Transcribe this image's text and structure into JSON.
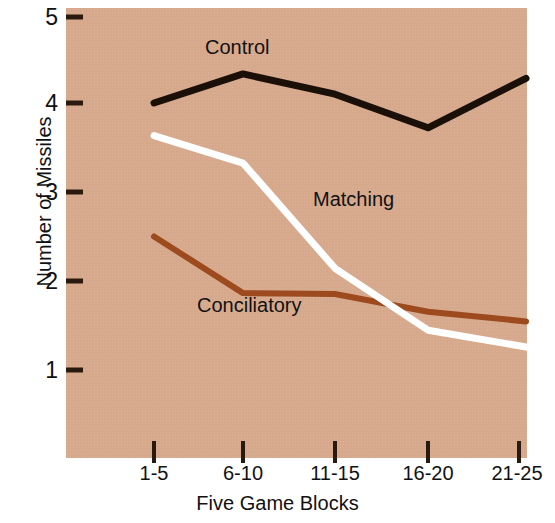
{
  "chart_data": {
    "type": "line",
    "title": "",
    "xlabel": "Five Game Blocks",
    "ylabel": "Number of Missiles",
    "categories": [
      "1-5",
      "6-10",
      "11-15",
      "16-20",
      "21-25"
    ],
    "ylim": [
      0.35,
      5.0
    ],
    "yticks": [
      1,
      2,
      3,
      4,
      5
    ],
    "ytick_labels": [
      "1",
      "2",
      "3",
      "4",
      "5"
    ],
    "grid": false,
    "legend": "inline-annotations",
    "background_color": "#d7a98c",
    "series": [
      {
        "name": "Control",
        "color": "#1a1008",
        "values": [
          4.02,
          4.35,
          4.12,
          3.74,
          4.3
        ],
        "label_x_category": "6-10",
        "label": "Control"
      },
      {
        "name": "Matching",
        "color": "#ffffff",
        "values": [
          3.65,
          3.34,
          2.15,
          1.45,
          1.26
        ],
        "label_x_category": "11-15",
        "label": "Matching"
      },
      {
        "name": "Conciliatory",
        "color": "#9c4a1e",
        "values": [
          2.51,
          1.87,
          1.86,
          1.66,
          1.55
        ],
        "label_x_category": "6-10",
        "label": "Conciliatory"
      }
    ],
    "annotations": [
      {
        "text": "Control",
        "x_px": 205,
        "y_px": 48
      },
      {
        "text": "Matching",
        "x_px": 313,
        "y_px": 200
      },
      {
        "text": "Conciliatory",
        "x_px": 197,
        "y_px": 306
      }
    ]
  }
}
